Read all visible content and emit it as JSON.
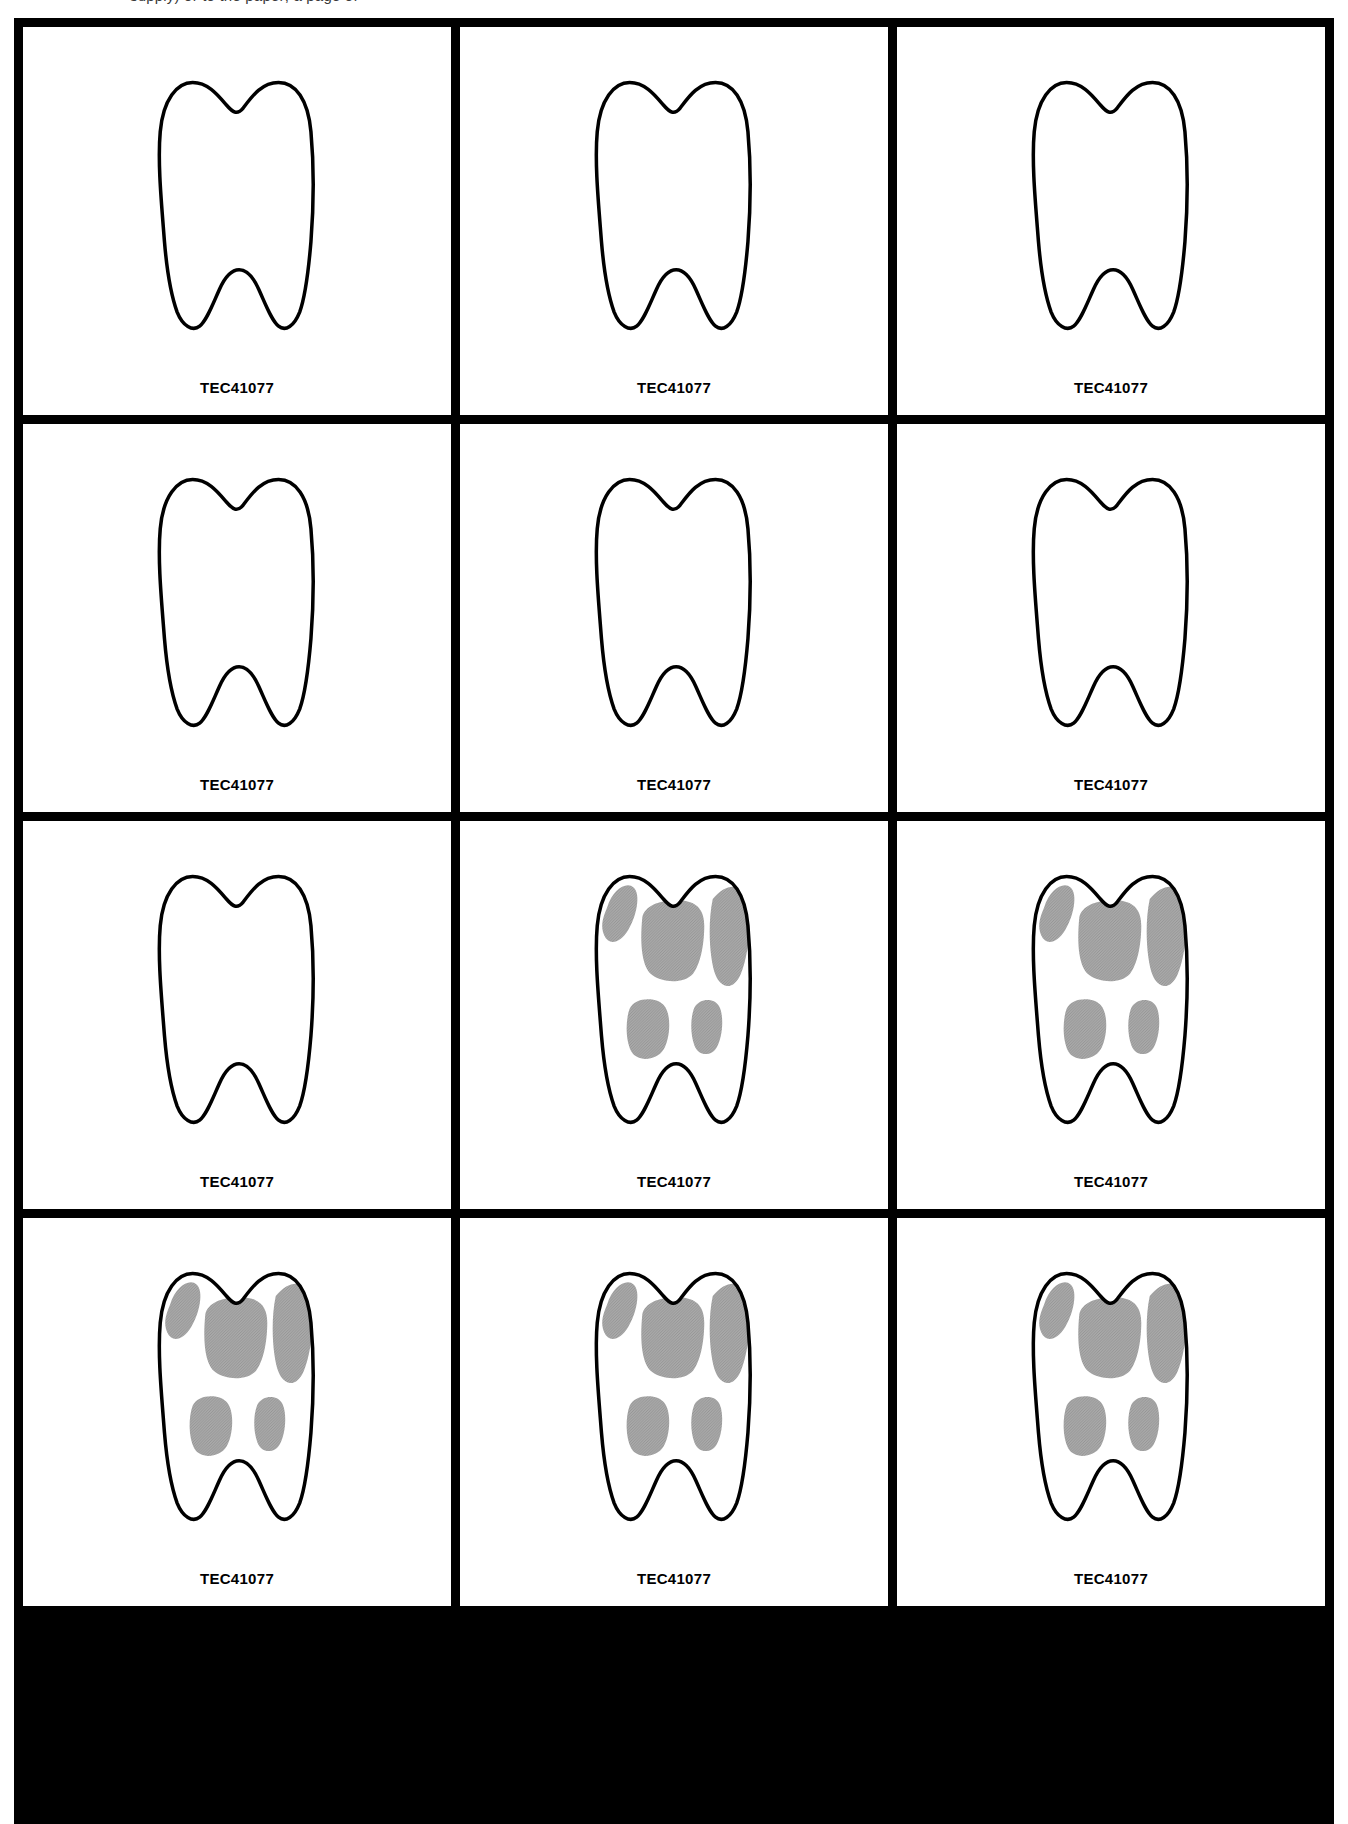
{
  "page": {
    "clipped_header_text": "supply) or to the paper; a page of",
    "width": 1348,
    "height": 1824
  },
  "colors": {
    "border": "#000000",
    "cell_background": "#ffffff",
    "outline": "#000000",
    "lesion_fill": "#a9a9a9",
    "label_text": "#000000"
  },
  "grid": {
    "columns": 3,
    "rows": 4,
    "gap_px": 9,
    "border_px": 9
  },
  "label": {
    "text": "TEC41077"
  },
  "cells": [
    {
      "id": "cell-r1c1",
      "row": 1,
      "col": 1,
      "label": "TEC41077",
      "has_lesions": false,
      "lesion_count": 0
    },
    {
      "id": "cell-r1c2",
      "row": 1,
      "col": 2,
      "label": "TEC41077",
      "has_lesions": false,
      "lesion_count": 0
    },
    {
      "id": "cell-r1c3",
      "row": 1,
      "col": 3,
      "label": "TEC41077",
      "has_lesions": false,
      "lesion_count": 0
    },
    {
      "id": "cell-r2c1",
      "row": 2,
      "col": 1,
      "label": "TEC41077",
      "has_lesions": false,
      "lesion_count": 0
    },
    {
      "id": "cell-r2c2",
      "row": 2,
      "col": 2,
      "label": "TEC41077",
      "has_lesions": false,
      "lesion_count": 0
    },
    {
      "id": "cell-r2c3",
      "row": 2,
      "col": 3,
      "label": "TEC41077",
      "has_lesions": false,
      "lesion_count": 0
    },
    {
      "id": "cell-r3c1",
      "row": 3,
      "col": 1,
      "label": "TEC41077",
      "has_lesions": false,
      "lesion_count": 0
    },
    {
      "id": "cell-r3c2",
      "row": 3,
      "col": 2,
      "label": "TEC41077",
      "has_lesions": true,
      "lesion_count": 5
    },
    {
      "id": "cell-r3c3",
      "row": 3,
      "col": 3,
      "label": "TEC41077",
      "has_lesions": true,
      "lesion_count": 5
    },
    {
      "id": "cell-r4c1",
      "row": 4,
      "col": 1,
      "label": "TEC41077",
      "has_lesions": true,
      "lesion_count": 5
    },
    {
      "id": "cell-r4c2",
      "row": 4,
      "col": 2,
      "label": "TEC41077",
      "has_lesions": true,
      "lesion_count": 5
    },
    {
      "id": "cell-r4c3",
      "row": 4,
      "col": 3,
      "label": "TEC41077",
      "has_lesions": true,
      "lesion_count": 5
    }
  ]
}
